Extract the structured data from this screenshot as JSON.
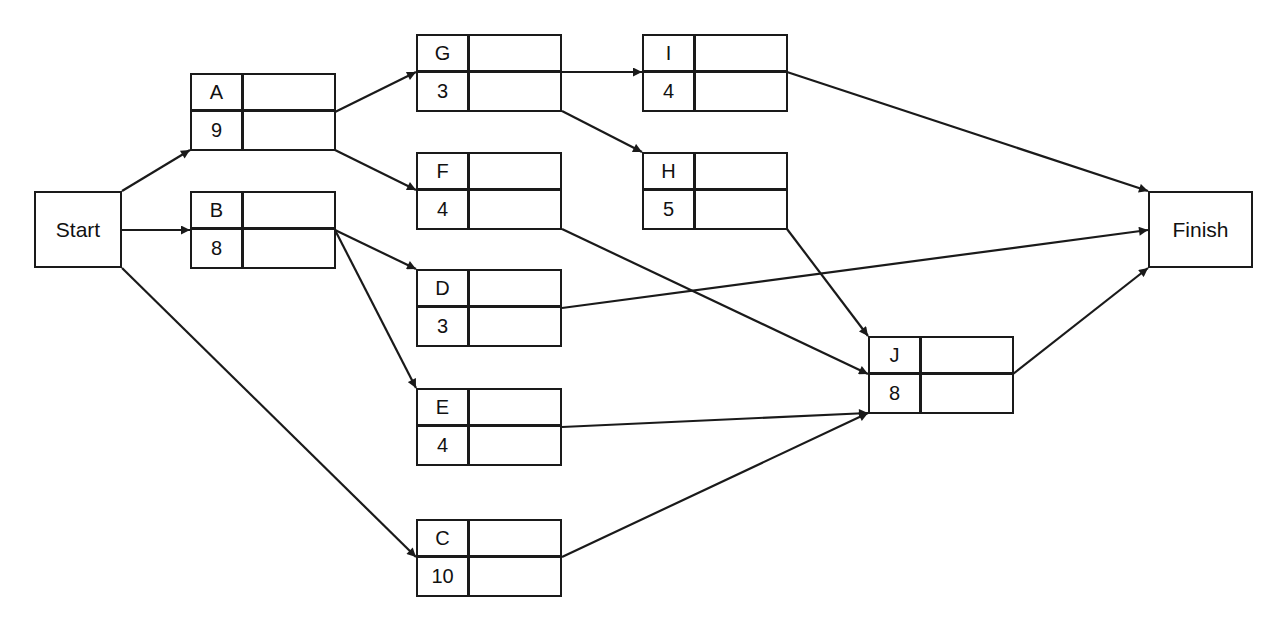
{
  "diagram": {
    "type": "activity-on-node network",
    "start": {
      "label": "Start",
      "x": 34,
      "y": 191,
      "w": 88,
      "h": 77
    },
    "finish": {
      "label": "Finish",
      "x": 1148,
      "y": 191,
      "w": 105,
      "h": 77
    },
    "tasks": [
      {
        "id": "A",
        "duration": "9",
        "x": 190,
        "y": 73
      },
      {
        "id": "B",
        "duration": "8",
        "x": 190,
        "y": 191
      },
      {
        "id": "G",
        "duration": "3",
        "x": 416,
        "y": 34
      },
      {
        "id": "F",
        "duration": "4",
        "x": 416,
        "y": 152
      },
      {
        "id": "D",
        "duration": "3",
        "x": 416,
        "y": 269
      },
      {
        "id": "E",
        "duration": "4",
        "x": 416,
        "y": 388
      },
      {
        "id": "C",
        "duration": "10",
        "x": 416,
        "y": 519
      },
      {
        "id": "I",
        "duration": "4",
        "x": 642,
        "y": 34
      },
      {
        "id": "H",
        "duration": "5",
        "x": 642,
        "y": 152
      },
      {
        "id": "J",
        "duration": "8",
        "x": 868,
        "y": 336
      }
    ],
    "edges": [
      {
        "from": "Start",
        "to": "A",
        "x1": 122,
        "y1": 191,
        "x2": 190,
        "y2": 150
      },
      {
        "from": "Start",
        "to": "B",
        "x1": 122,
        "y1": 230,
        "x2": 190,
        "y2": 230
      },
      {
        "from": "Start",
        "to": "C",
        "x1": 122,
        "y1": 268,
        "x2": 416,
        "y2": 557
      },
      {
        "from": "A",
        "to": "G",
        "x1": 335,
        "y1": 112,
        "x2": 416,
        "y2": 72
      },
      {
        "from": "A",
        "to": "F",
        "x1": 335,
        "y1": 150,
        "x2": 416,
        "y2": 190
      },
      {
        "from": "B",
        "to": "D",
        "x1": 335,
        "y1": 230,
        "x2": 416,
        "y2": 269
      },
      {
        "from": "B",
        "to": "E",
        "x1": 335,
        "y1": 230,
        "x2": 416,
        "y2": 388
      },
      {
        "from": "G",
        "to": "I",
        "x1": 562,
        "y1": 72,
        "x2": 642,
        "y2": 72
      },
      {
        "from": "G",
        "to": "H",
        "x1": 562,
        "y1": 111,
        "x2": 642,
        "y2": 152
      },
      {
        "from": "I",
        "to": "Finish",
        "x1": 787,
        "y1": 72,
        "x2": 1148,
        "y2": 191
      },
      {
        "from": "D",
        "to": "Finish",
        "x1": 562,
        "y1": 308,
        "x2": 1148,
        "y2": 230
      },
      {
        "from": "F",
        "to": "J",
        "x1": 562,
        "y1": 229,
        "x2": 868,
        "y2": 374
      },
      {
        "from": "H",
        "to": "J",
        "x1": 787,
        "y1": 229,
        "x2": 868,
        "y2": 336
      },
      {
        "from": "E",
        "to": "J",
        "x1": 562,
        "y1": 427,
        "x2": 868,
        "y2": 413
      },
      {
        "from": "C",
        "to": "J",
        "x1": 562,
        "y1": 557,
        "x2": 868,
        "y2": 413
      },
      {
        "from": "J",
        "to": "Finish",
        "x1": 1013,
        "y1": 374,
        "x2": 1148,
        "y2": 268
      }
    ],
    "colors": {
      "line": "#1a1a1a",
      "background": "#ffffff"
    }
  }
}
